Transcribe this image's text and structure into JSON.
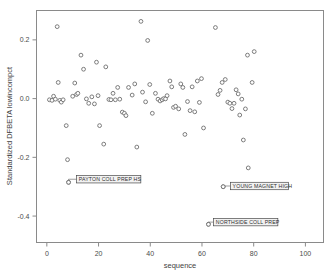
{
  "chart_data": {
    "type": "scatter",
    "title": "",
    "xlabel": "sequence",
    "ylabel": "Standardized DFBETA lowincompct",
    "xlim": [
      -4,
      107
    ],
    "ylim": [
      -0.49,
      0.3
    ],
    "xticks": [
      0,
      20,
      40,
      60,
      80,
      100
    ],
    "xtick_labels": [
      "0",
      "20",
      "40",
      "60",
      "80",
      "100"
    ],
    "yticks": [
      0.2,
      0.0,
      -0.2,
      -0.4
    ],
    "ytick_labels": [
      "0.2",
      "0.0",
      "-0.2",
      "-0.4"
    ],
    "grid": false,
    "legend": "none",
    "marker": "open-circle",
    "marker_color": "#6e6e6e",
    "points": [
      {
        "x": 1,
        "y": -0.004
      },
      {
        "x": 2,
        "y": -0.006
      },
      {
        "x": 2.6,
        "y": 0.008
      },
      {
        "x": 3.3,
        "y": -0.002
      },
      {
        "x": 4,
        "y": 0.245
      },
      {
        "x": 4.4,
        "y": 0.055
      },
      {
        "x": 5,
        "y": -0.006
      },
      {
        "x": 5.6,
        "y": -0.012
      },
      {
        "x": 6.3,
        "y": -0.004
      },
      {
        "x": 7.5,
        "y": -0.092
      },
      {
        "x": 8,
        "y": -0.208
      },
      {
        "x": 8.4,
        "y": -0.285
      },
      {
        "x": 10,
        "y": 0.008
      },
      {
        "x": 10.8,
        "y": 0.053
      },
      {
        "x": 11.5,
        "y": 0.014
      },
      {
        "x": 12,
        "y": 0.018
      },
      {
        "x": 13.2,
        "y": 0.148
      },
      {
        "x": 14.2,
        "y": 0.1
      },
      {
        "x": 15.3,
        "y": -0.001
      },
      {
        "x": 16.2,
        "y": -0.016
      },
      {
        "x": 17.4,
        "y": 0.006
      },
      {
        "x": 18.4,
        "y": -0.018
      },
      {
        "x": 19.2,
        "y": 0.124
      },
      {
        "x": 19.8,
        "y": 0.01
      },
      {
        "x": 20.4,
        "y": -0.092
      },
      {
        "x": 22,
        "y": -0.155
      },
      {
        "x": 22.8,
        "y": 0.108
      },
      {
        "x": 24,
        "y": -0.003
      },
      {
        "x": 24.8,
        "y": -0.004
      },
      {
        "x": 25.6,
        "y": 0.018
      },
      {
        "x": 26.5,
        "y": -0.004
      },
      {
        "x": 27.4,
        "y": 0.038
      },
      {
        "x": 28.2,
        "y": -0.002
      },
      {
        "x": 29.2,
        "y": -0.046
      },
      {
        "x": 30,
        "y": -0.05
      },
      {
        "x": 30.6,
        "y": -0.058
      },
      {
        "x": 31.6,
        "y": 0.038
      },
      {
        "x": 33,
        "y": 0.012
      },
      {
        "x": 34,
        "y": 0.05
      },
      {
        "x": 34.8,
        "y": -0.165
      },
      {
        "x": 36.4,
        "y": 0.263
      },
      {
        "x": 37,
        "y": 0.022
      },
      {
        "x": 38.2,
        "y": -0.011
      },
      {
        "x": 39,
        "y": 0.198
      },
      {
        "x": 39.8,
        "y": 0.048
      },
      {
        "x": 40.8,
        "y": -0.05
      },
      {
        "x": 42,
        "y": 0.018
      },
      {
        "x": 43,
        "y": -0.002
      },
      {
        "x": 43.8,
        "y": -0.008
      },
      {
        "x": 44.6,
        "y": -0.004
      },
      {
        "x": 45.2,
        "y": 0.0
      },
      {
        "x": 45.9,
        "y": -0.001
      },
      {
        "x": 46.5,
        "y": 0.01
      },
      {
        "x": 47.6,
        "y": 0.06
      },
      {
        "x": 48.3,
        "y": 0.04
      },
      {
        "x": 49,
        "y": -0.03
      },
      {
        "x": 49.8,
        "y": -0.026
      },
      {
        "x": 51,
        "y": -0.035
      },
      {
        "x": 51.8,
        "y": 0.05
      },
      {
        "x": 52.6,
        "y": 0.038
      },
      {
        "x": 53.4,
        "y": -0.122
      },
      {
        "x": 54.4,
        "y": -0.01
      },
      {
        "x": 55.4,
        "y": -0.041
      },
      {
        "x": 56.2,
        "y": 0.04
      },
      {
        "x": 57.2,
        "y": -0.045
      },
      {
        "x": 58.2,
        "y": 0.06
      },
      {
        "x": 59,
        "y": -0.013
      },
      {
        "x": 59.8,
        "y": 0.068
      },
      {
        "x": 60.6,
        "y": -0.1
      },
      {
        "x": 62.5,
        "y": -0.428
      },
      {
        "x": 65.2,
        "y": 0.242
      },
      {
        "x": 66.2,
        "y": 0.014
      },
      {
        "x": 67,
        "y": 0.028
      },
      {
        "x": 67.8,
        "y": 0.055
      },
      {
        "x": 68.2,
        "y": -0.3
      },
      {
        "x": 69,
        "y": 0.065
      },
      {
        "x": 70,
        "y": -0.012
      },
      {
        "x": 70.8,
        "y": -0.016
      },
      {
        "x": 71.6,
        "y": -0.034
      },
      {
        "x": 72.4,
        "y": -0.016
      },
      {
        "x": 73.2,
        "y": 0.03
      },
      {
        "x": 74,
        "y": 0.016
      },
      {
        "x": 74.6,
        "y": -0.056
      },
      {
        "x": 75.4,
        "y": -0.002
      },
      {
        "x": 76,
        "y": -0.141
      },
      {
        "x": 76.8,
        "y": -0.035
      },
      {
        "x": 77.6,
        "y": 0.148
      },
      {
        "x": 77.9,
        "y": -0.236
      },
      {
        "x": 79.4,
        "y": 0.055
      },
      {
        "x": 80.2,
        "y": 0.16
      }
    ],
    "annotations": [
      {
        "label": "PAYTON COLL PREP HS",
        "point_x": 8.4,
        "point_y": -0.285,
        "box_x": 11.5,
        "box_y": -0.262
      },
      {
        "label": "YOUNG MAGNET HIGH",
        "point_x": 68.2,
        "point_y": -0.3,
        "box_x": 71.0,
        "box_y": -0.285
      },
      {
        "label": "NORTHSIDE COLL PREP",
        "point_x": 62.5,
        "point_y": -0.428,
        "box_x": 64.5,
        "box_y": -0.408
      }
    ]
  }
}
